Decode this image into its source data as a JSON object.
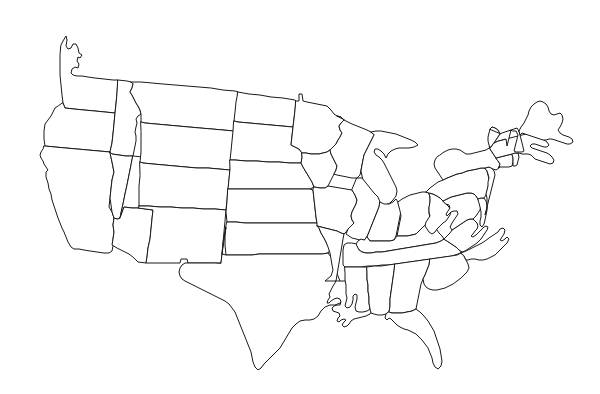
{
  "figure": {
    "kind": "outline-map",
    "region": "Contiguous United States (Lower 48)",
    "caption": "",
    "has_labels": false,
    "has_legend": false,
    "has_title_text": false,
    "background_color": "#ffffff",
    "outline_color": "#1a1a1a",
    "fill_color": "#ffffff",
    "stroke_width_px": 1,
    "canvas": {
      "width": 600,
      "height": 394
    },
    "map_extent_px": {
      "left": 33,
      "top": 26,
      "right": 573,
      "bottom": 371
    },
    "projection_hint": "conic (Albers-like), north border arcs upward toward center"
  },
  "chart_data": {
    "type": "map",
    "title": "",
    "projection": "albers-usa-like",
    "feature_count": 49,
    "features": [
      {
        "code": "WA",
        "name": "Washington"
      },
      {
        "code": "OR",
        "name": "Oregon"
      },
      {
        "code": "CA",
        "name": "California"
      },
      {
        "code": "ID",
        "name": "Idaho"
      },
      {
        "code": "NV",
        "name": "Nevada"
      },
      {
        "code": "UT",
        "name": "Utah"
      },
      {
        "code": "AZ",
        "name": "Arizona"
      },
      {
        "code": "MT",
        "name": "Montana"
      },
      {
        "code": "WY",
        "name": "Wyoming"
      },
      {
        "code": "CO",
        "name": "Colorado"
      },
      {
        "code": "NM",
        "name": "New Mexico"
      },
      {
        "code": "ND",
        "name": "North Dakota"
      },
      {
        "code": "SD",
        "name": "South Dakota"
      },
      {
        "code": "NE",
        "name": "Nebraska"
      },
      {
        "code": "KS",
        "name": "Kansas"
      },
      {
        "code": "OK",
        "name": "Oklahoma"
      },
      {
        "code": "TX",
        "name": "Texas"
      },
      {
        "code": "MN",
        "name": "Minnesota"
      },
      {
        "code": "IA",
        "name": "Iowa"
      },
      {
        "code": "MO",
        "name": "Missouri"
      },
      {
        "code": "AR",
        "name": "Arkansas"
      },
      {
        "code": "LA",
        "name": "Louisiana"
      },
      {
        "code": "WI",
        "name": "Wisconsin"
      },
      {
        "code": "IL",
        "name": "Illinois"
      },
      {
        "code": "MI",
        "name": "Michigan"
      },
      {
        "code": "IN",
        "name": "Indiana"
      },
      {
        "code": "OH",
        "name": "Ohio"
      },
      {
        "code": "KY",
        "name": "Kentucky"
      },
      {
        "code": "TN",
        "name": "Tennessee"
      },
      {
        "code": "MS",
        "name": "Mississippi"
      },
      {
        "code": "AL",
        "name": "Alabama"
      },
      {
        "code": "GA",
        "name": "Georgia"
      },
      {
        "code": "FL",
        "name": "Florida"
      },
      {
        "code": "SC",
        "name": "South Carolina"
      },
      {
        "code": "NC",
        "name": "North Carolina"
      },
      {
        "code": "VA",
        "name": "Virginia"
      },
      {
        "code": "WV",
        "name": "West Virginia"
      },
      {
        "code": "MD",
        "name": "Maryland"
      },
      {
        "code": "DE",
        "name": "Delaware"
      },
      {
        "code": "PA",
        "name": "Pennsylvania"
      },
      {
        "code": "NJ",
        "name": "New Jersey"
      },
      {
        "code": "NY",
        "name": "New York"
      },
      {
        "code": "CT",
        "name": "Connecticut"
      },
      {
        "code": "RI",
        "name": "Rhode Island"
      },
      {
        "code": "MA",
        "name": "Massachusetts"
      },
      {
        "code": "VT",
        "name": "Vermont"
      },
      {
        "code": "NH",
        "name": "New Hampshire"
      },
      {
        "code": "ME",
        "name": "Maine"
      },
      {
        "code": "DC",
        "name": "District of Columbia"
      }
    ]
  }
}
